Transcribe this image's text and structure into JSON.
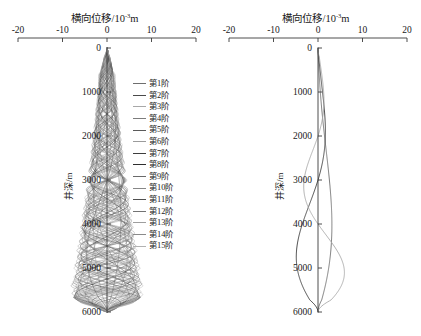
{
  "figure": {
    "width": 421,
    "height": 336,
    "background": "#ffffff"
  },
  "panels": [
    {
      "id": "left",
      "name": "first-15-modes-panel",
      "axis_title": "横向位移/10",
      "axis_title_exponent": "-3",
      "axis_title_unit": "m",
      "ylabel": "井深/m",
      "legend_labels": [
        "第1阶",
        "第2阶",
        "第3阶",
        "第4阶",
        "第5阶",
        "第6阶",
        "第7阶",
        "第8阶",
        "第9阶",
        "第10阶",
        "第11阶",
        "第12阶",
        "第13阶",
        "第14阶",
        "第15阶"
      ]
    },
    {
      "id": "right",
      "name": "first-3-modes-panel",
      "axis_title": "横向位移/10",
      "axis_title_exponent": "-3",
      "axis_title_unit": "m",
      "ylabel": "井深/m",
      "legend_labels": [
        "第1阶",
        "第2阶",
        "第3阶"
      ]
    }
  ],
  "chart_data": [
    {
      "type": "line",
      "id": "left-panel",
      "title": "横向位移/10⁻³m",
      "xlabel": "横向位移/10⁻³m",
      "ylabel": "井深/m",
      "xlim": [
        -20,
        20
      ],
      "ylim": [
        6000,
        0
      ],
      "xticks": [
        -20,
        -10,
        0,
        10,
        20
      ],
      "yticks": [
        0,
        1000,
        2000,
        3000,
        4000,
        5000,
        6000
      ],
      "xtick_labels": [
        "-20",
        "-10",
        "0",
        "10",
        "20"
      ],
      "ytick_labels": [
        "0",
        "1000",
        "2000",
        "3000",
        "4000",
        "5000",
        "6000"
      ],
      "x_axis_position": "top",
      "y_axis_inverted": true,
      "grid": false,
      "legend_position": "right",
      "series": [
        {
          "name": "第1阶",
          "color": "#6e6e6e",
          "half_waves": 1,
          "amp": 3.0
        },
        {
          "name": "第2阶",
          "color": "#4a4a4a",
          "half_waves": 2,
          "amp": 3.3
        },
        {
          "name": "第3阶",
          "color": "#a8a8a8",
          "half_waves": 3,
          "amp": 3.5
        },
        {
          "name": "第4阶",
          "color": "#7c7c7c",
          "half_waves": 4,
          "amp": 3.7
        },
        {
          "name": "第5阶",
          "color": "#5a5a5a",
          "half_waves": 5,
          "amp": 3.9
        },
        {
          "name": "第6阶",
          "color": "#9b9b9b",
          "half_waves": 6,
          "amp": 4.0
        },
        {
          "name": "第7阶",
          "color": "#3d3d3d",
          "half_waves": 7,
          "amp": 4.1
        },
        {
          "name": "第8阶",
          "color": "#2e2e2e",
          "half_waves": 8,
          "amp": 4.2
        },
        {
          "name": "第9阶",
          "color": "#6a6a6a",
          "half_waves": 9,
          "amp": 4.3
        },
        {
          "name": "第10阶",
          "color": "#878787",
          "half_waves": 10,
          "amp": 4.4
        },
        {
          "name": "第11阶",
          "color": "#4f4f4f",
          "half_waves": 11,
          "amp": 4.5
        },
        {
          "name": "第12阶",
          "color": "#737373",
          "half_waves": 12,
          "amp": 4.6
        },
        {
          "name": "第13阶",
          "color": "#9e9e9e",
          "half_waves": 13,
          "amp": 4.7
        },
        {
          "name": "第14阶",
          "color": "#8a8a8a",
          "half_waves": 14,
          "amp": 4.8
        },
        {
          "name": "第15阶",
          "color": "#b2b2b2",
          "half_waves": 15,
          "amp": 4.9
        }
      ]
    },
    {
      "type": "line",
      "id": "right-panel",
      "title": "横向位移/10⁻³m",
      "xlabel": "横向位移/10⁻³m",
      "ylabel": "井深/m",
      "xlim": [
        -20,
        20
      ],
      "ylim": [
        6000,
        0
      ],
      "xticks": [
        -20,
        -10,
        0,
        10,
        20
      ],
      "yticks": [
        0,
        1000,
        2000,
        3000,
        4000,
        5000,
        6000
      ],
      "xtick_labels": [
        "-20",
        "-10",
        "0",
        "10",
        "20"
      ],
      "ytick_labels": [
        "0",
        "1000",
        "2000",
        "3000",
        "4000",
        "5000",
        "6000"
      ],
      "x_axis_position": "top",
      "y_axis_inverted": true,
      "grid": false,
      "legend_position": "right",
      "series": [
        {
          "name": "第1阶",
          "color": "#6e6e6e",
          "half_waves": 1,
          "amp": 3.2
        },
        {
          "name": "第2阶",
          "color": "#3c3c3c",
          "half_waves": 2,
          "amp": 3.6
        },
        {
          "name": "第3阶",
          "color": "#a9a9a9",
          "half_waves": 3,
          "amp": 3.9
        }
      ]
    }
  ]
}
